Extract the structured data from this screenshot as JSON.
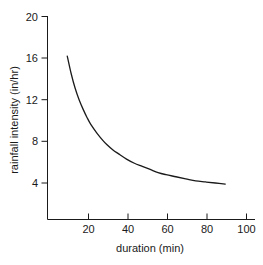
{
  "chart_data": {
    "type": "line",
    "title": "",
    "xlabel": "duration (min)",
    "ylabel": "rainfall intensity (in/hr)",
    "xlim": [
      0,
      100
    ],
    "ylim": [
      0,
      20
    ],
    "xticks": [
      20,
      40,
      60,
      80,
      100
    ],
    "yticks": [
      4,
      8,
      12,
      16,
      20
    ],
    "xtick_labels": [
      "20",
      "40",
      "60",
      "80",
      "100"
    ],
    "ytick_labels": [
      "4",
      "8",
      "12",
      "16",
      "20"
    ],
    "grid": false,
    "legend": false,
    "series": [
      {
        "name": "rainfall intensity",
        "x": [
          10,
          12,
          14,
          16,
          18,
          20,
          22,
          25,
          28,
          30,
          33,
          36,
          40,
          44,
          48,
          52,
          56,
          60,
          65,
          70,
          75,
          80,
          85,
          90
        ],
        "values": [
          16.2,
          14.5,
          13.1,
          12.0,
          11.1,
          10.3,
          9.6,
          8.8,
          8.1,
          7.7,
          7.2,
          6.8,
          6.3,
          5.9,
          5.6,
          5.3,
          5.0,
          4.8,
          4.6,
          4.4,
          4.2,
          4.1,
          4.0,
          3.9
        ]
      }
    ],
    "annotations": []
  },
  "axis": {
    "x_title": "duration (min)",
    "y_title": "rainfall intensity (in/hr)",
    "x_tick_labels": [
      "20",
      "40",
      "60",
      "80",
      "100"
    ],
    "y_tick_labels": [
      "4",
      "8",
      "12",
      "16",
      "20"
    ]
  },
  "colors": {
    "curve": "#1a1a1a",
    "axis": "#1a1a1a",
    "text": "#1a1a1a",
    "background": "#ffffff"
  }
}
